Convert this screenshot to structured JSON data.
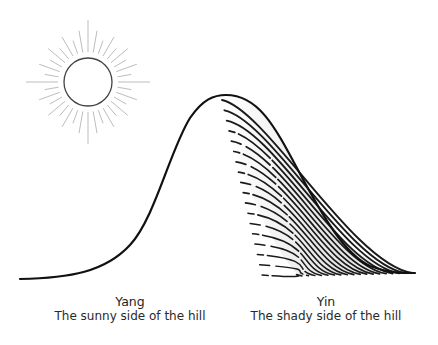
{
  "diagram": {
    "colors": {
      "background": "#ffffff",
      "hill_outline": "#111111",
      "sun_outline": "#444444",
      "sun_rays": "#bbbbbb",
      "shade_lines": "#1a1a1a",
      "shade_fill": "#e6e6e6",
      "text": "#1e1e1e"
    },
    "sun": {
      "cx": 88,
      "cy": 82,
      "r": 24,
      "ray_inner": 30,
      "ray_outer_short": 48,
      "ray_outer_long": 62,
      "ray_count": 36
    },
    "hill": {
      "start": [
        20,
        279
      ],
      "peak": [
        224,
        95
      ],
      "end": [
        415,
        273
      ]
    },
    "labels": [
      {
        "id": "yang",
        "title": "Yang",
        "subtitle": "The sunny side of the hill"
      },
      {
        "id": "yin",
        "title": "Yin",
        "subtitle": "The shady side of the hill"
      }
    ]
  }
}
